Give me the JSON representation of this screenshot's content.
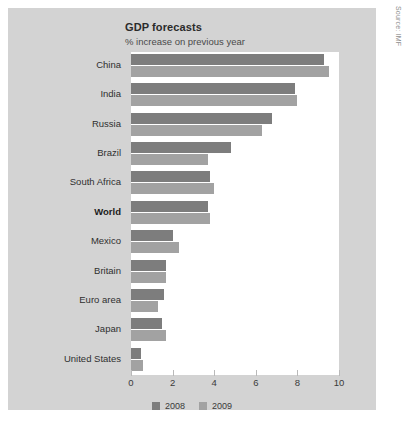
{
  "source_credit": "Source: IMF",
  "chart_data": {
    "type": "bar",
    "orientation": "horizontal",
    "title": "GDP forecasts",
    "subtitle": "% increase on previous year",
    "xlabel": "",
    "ylabel": "",
    "xlim": [
      0,
      10
    ],
    "xticks": [
      "0",
      "2",
      "4",
      "6",
      "8",
      "10"
    ],
    "xtick_values": [
      0,
      2,
      4,
      6,
      8,
      10
    ],
    "grid": false,
    "legend_position": "bottom",
    "categories": [
      "China",
      "India",
      "Russia",
      "Brazil",
      "South Africa",
      "World",
      "Mexico",
      "Britain",
      "Euro area",
      "Japan",
      "United States"
    ],
    "highlighted_category": "World",
    "series": [
      {
        "name": "2008",
        "color": "#7d7d7d",
        "values": [
          9.3,
          7.9,
          6.8,
          4.8,
          3.8,
          3.7,
          2.0,
          1.7,
          1.6,
          1.5,
          0.5
        ]
      },
      {
        "name": "2009",
        "color": "#a2a2a2",
        "values": [
          9.5,
          8.0,
          6.3,
          3.7,
          4.0,
          3.8,
          2.3,
          1.7,
          1.3,
          1.7,
          0.6
        ]
      }
    ]
  }
}
